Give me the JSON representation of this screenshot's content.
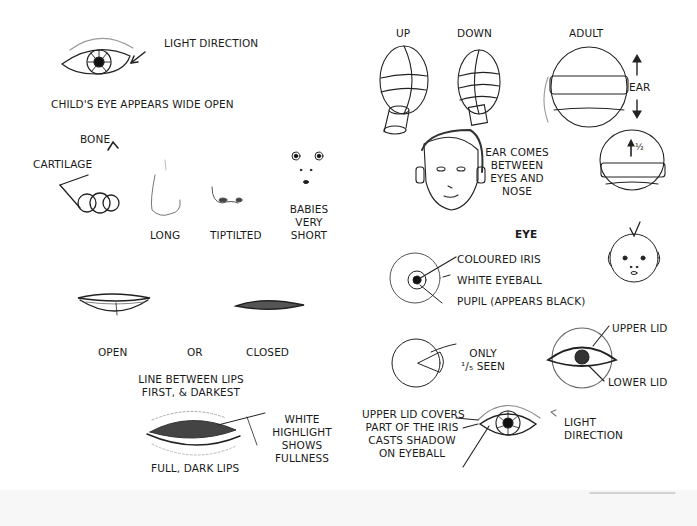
{
  "page": {
    "left": {
      "eye_section": {
        "light_direction": "LIGHT DIRECTION",
        "caption": "CHILD'S EYE APPEARS WIDE OPEN"
      },
      "nose_section": {
        "bone": "BONE",
        "cartilage": "CARTILAGE",
        "long": "LONG",
        "tiptilted": "TIPTILTED",
        "babies": [
          "BABIES",
          "VERY",
          "SHORT"
        ]
      },
      "lips_section": {
        "open": "OPEN",
        "or": "OR",
        "closed": "CLOSED",
        "line_note": [
          "LINE BETWEEN LIPS",
          "FIRST, & DARKEST"
        ],
        "full_dark": "FULL, DARK LIPS",
        "highlight_note": [
          "WHITE",
          "HIGHLIGHT",
          "SHOWS",
          "FULLNESS"
        ]
      }
    },
    "right": {
      "head_section": {
        "up": "UP",
        "down": "DOWN",
        "adult": "ADULT",
        "ear": "EAR",
        "half": "½",
        "ear_note": [
          "EAR COMES",
          "BETWEEN",
          "EYES AND",
          "NOSE"
        ]
      },
      "eye_section": {
        "heading": "EYE",
        "iris": "COLOURED IRIS",
        "eyeball": "WHITE EYEBALL",
        "pupil": "PUPIL (APPEARS BLACK)",
        "only_seen": [
          "ONLY",
          "¹/₅ SEEN"
        ],
        "upper_lid": "UPPER LID",
        "lower_lid": "LOWER LID",
        "lid_note": [
          "UPPER LID COVERS",
          "PART OF THE IRIS",
          "CASTS SHADOW",
          "ON EYEBALL"
        ],
        "light_direction": [
          "LIGHT",
          "DIRECTION"
        ]
      }
    }
  }
}
